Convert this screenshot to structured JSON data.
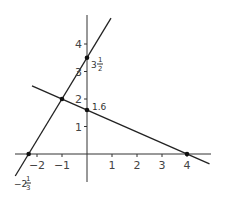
{
  "chart_data": {
    "type": "line",
    "title": "",
    "xlabel": "",
    "ylabel": "",
    "xlim": [
      -2.9,
      5.0
    ],
    "ylim": [
      -1.0,
      5.0
    ],
    "grid": false,
    "x_ticks": [
      -2,
      -1,
      1,
      2,
      3,
      4
    ],
    "x_tick_labels": [
      "−2",
      "−1",
      "1",
      "2",
      "3",
      "4"
    ],
    "y_ticks": [
      1,
      2,
      3,
      4
    ],
    "y_tick_labels": [
      "1",
      "2",
      "3",
      "4"
    ],
    "series": [
      {
        "name": "steep line",
        "equation": "y = 1.5x + 3.5",
        "x": [
          -2.87,
          0.96
        ],
        "y": [
          -0.8,
          4.94
        ]
      },
      {
        "name": "shallow line",
        "equation": "y = -0.4x + 1.6",
        "x": [
          -2.2,
          4.9
        ],
        "y": [
          2.48,
          -0.36
        ]
      }
    ],
    "points": [
      {
        "name": "y-intercept-steep",
        "x": 0,
        "y": 3.5
      },
      {
        "name": "x-intercept-steep",
        "x": -2.3333,
        "y": 0
      },
      {
        "name": "intersection",
        "x": -1,
        "y": 2
      },
      {
        "name": "y-intercept-shallow",
        "x": 0,
        "y": 1.6
      },
      {
        "name": "x-intercept-shallow",
        "x": 4,
        "y": 0
      }
    ],
    "annotations": {
      "steep_y_intercept": {
        "whole": "3",
        "num": "1",
        "den": "2"
      },
      "steep_x_intercept": {
        "whole": "−2",
        "num": "1",
        "den": "3"
      },
      "shallow_y_intercept": "1.6"
    }
  }
}
